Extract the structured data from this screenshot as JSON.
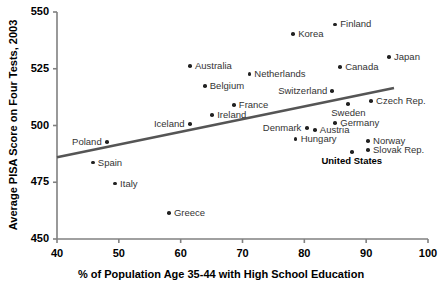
{
  "chart_data": {
    "type": "scatter",
    "title": "",
    "xlabel": "% of Population Age 35-44 with High School Education",
    "ylabel": "Average PISA Score on Four Tests, 2003",
    "xlim": [
      40,
      100
    ],
    "ylim": [
      450,
      550
    ],
    "xticks": [
      40,
      50,
      60,
      70,
      80,
      90,
      100
    ],
    "yticks": [
      450,
      475,
      500,
      525,
      550
    ],
    "grid": false,
    "legend": false,
    "point_color": "#222222",
    "trendline_color": "#555555",
    "trendline": {
      "x": [
        40,
        94.5
      ],
      "y": [
        486.0,
        516.5
      ]
    },
    "points": [
      {
        "label": "Finland",
        "x": 85.0,
        "y": 544.5,
        "label_pos": "right",
        "bold": false
      },
      {
        "label": "Korea",
        "x": 78.2,
        "y": 540.3,
        "label_pos": "right",
        "bold": false
      },
      {
        "label": "Japan",
        "x": 93.7,
        "y": 530.2,
        "label_pos": "right",
        "bold": false
      },
      {
        "label": "Australia",
        "x": 61.5,
        "y": 526.2,
        "label_pos": "right",
        "bold": false
      },
      {
        "label": "Canada",
        "x": 85.8,
        "y": 525.8,
        "label_pos": "right",
        "bold": false
      },
      {
        "label": "Netherlands",
        "x": 71.1,
        "y": 522.7,
        "label_pos": "right",
        "bold": false
      },
      {
        "label": "Belgium",
        "x": 63.9,
        "y": 517.4,
        "label_pos": "right",
        "bold": false
      },
      {
        "label": "Switzerland",
        "x": 84.5,
        "y": 515.2,
        "label_pos": "left",
        "bold": false
      },
      {
        "label": "Czech Rep.",
        "x": 90.8,
        "y": 510.8,
        "label_pos": "right",
        "bold": false
      },
      {
        "label": "France",
        "x": 68.6,
        "y": 509.0,
        "label_pos": "right",
        "bold": false
      },
      {
        "label": "Sweden",
        "x": 87.1,
        "y": 509.5,
        "label_pos": "below",
        "bold": false
      },
      {
        "label": "Ireland",
        "x": 65.1,
        "y": 504.6,
        "label_pos": "right",
        "bold": false
      },
      {
        "label": "Germany",
        "x": 85.0,
        "y": 501.1,
        "label_pos": "right",
        "bold": false
      },
      {
        "label": "Iceland",
        "x": 61.5,
        "y": 500.6,
        "label_pos": "left",
        "bold": false
      },
      {
        "label": "Denmark",
        "x": 80.4,
        "y": 498.9,
        "label_pos": "left",
        "bold": false
      },
      {
        "label": "Austria",
        "x": 81.7,
        "y": 498.0,
        "label_pos": "right",
        "bold": false
      },
      {
        "label": "Poland",
        "x": 48.1,
        "y": 492.7,
        "label_pos": "left",
        "bold": false
      },
      {
        "label": "Norway",
        "x": 90.3,
        "y": 493.2,
        "label_pos": "right",
        "bold": false
      },
      {
        "label": "Hungary",
        "x": 78.6,
        "y": 494.0,
        "label_pos": "right",
        "bold": false
      },
      {
        "label": "Slovak Rep.",
        "x": 90.3,
        "y": 489.2,
        "label_pos": "right",
        "bold": false
      },
      {
        "label": "United States",
        "x": 87.7,
        "y": 488.3,
        "label_pos": "below",
        "bold": true
      },
      {
        "label": "Spain",
        "x": 45.8,
        "y": 483.7,
        "label_pos": "right",
        "bold": false
      },
      {
        "label": "Italy",
        "x": 49.4,
        "y": 474.4,
        "label_pos": "right",
        "bold": false
      },
      {
        "label": "Greece",
        "x": 58.1,
        "y": 461.5,
        "label_pos": "right",
        "bold": false
      }
    ]
  }
}
